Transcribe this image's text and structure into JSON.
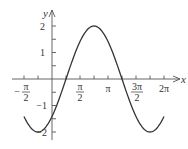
{
  "chart_data": {
    "type": "line",
    "title": "",
    "function": "y = 2 sin(x - π/4)",
    "xlabel": "x",
    "ylabel": "y",
    "xlim": [
      -1.5708,
      6.2832
    ],
    "ylim": [
      -2,
      2
    ],
    "grid": false,
    "legend": null,
    "x_ticks": [
      {
        "value": -1.5708,
        "label_num": "π",
        "label_den": "2",
        "sign": "−",
        "labeled": true
      },
      {
        "value": -0.7854,
        "labeled": false
      },
      {
        "value": 0.7854,
        "labeled": false
      },
      {
        "value": 1.5708,
        "label_num": "π",
        "label_den": "2",
        "sign": "",
        "labeled": true
      },
      {
        "value": 2.3562,
        "labeled": false
      },
      {
        "value": 3.1416,
        "label": "π",
        "labeled": true
      },
      {
        "value": 3.927,
        "labeled": false
      },
      {
        "value": 4.7124,
        "label_num": "3π",
        "label_den": "2",
        "sign": "",
        "labeled": true
      },
      {
        "value": 5.4978,
        "labeled": false
      },
      {
        "value": 6.2832,
        "label": "2π",
        "labeled": true
      }
    ],
    "y_ticks": [
      {
        "value": 2,
        "label": "2"
      },
      {
        "value": 1.5,
        "label": ""
      },
      {
        "value": 1,
        "label": "1"
      },
      {
        "value": 0.5,
        "label": ""
      },
      {
        "value": -0.5,
        "label": ""
      },
      {
        "value": -1,
        "label": "−1"
      },
      {
        "value": -1.5,
        "label": ""
      },
      {
        "value": -2,
        "label": "−2"
      }
    ],
    "series": [
      {
        "name": "y = 2 sin(x − π/4)",
        "color": "#333333",
        "x": [
          -1.5708,
          -0.7854,
          0,
          0.7854,
          1.5708,
          2.3562,
          3.1416,
          3.927,
          4.7124,
          5.4978,
          6.2832
        ],
        "y": [
          -1.414,
          -2,
          -1.414,
          0,
          1.414,
          2,
          1.414,
          0,
          -1.414,
          -2,
          -1.414
        ]
      }
    ]
  },
  "labels": {
    "x_axis": "x",
    "y_axis": "y",
    "neg_pi_half_sign": "−",
    "neg_pi_half_num": "π",
    "neg_pi_half_den": "2",
    "pi_half_num": "π",
    "pi_half_den": "2",
    "pi": "π",
    "three_pi_half_num": "3π",
    "three_pi_half_den": "2",
    "two_pi": "2π",
    "y2": "2",
    "y1": "1",
    "ym1": "−1",
    "ym2": "−2"
  },
  "colors": {
    "axis": "#555555",
    "curve": "#333333",
    "text": "#333333"
  }
}
